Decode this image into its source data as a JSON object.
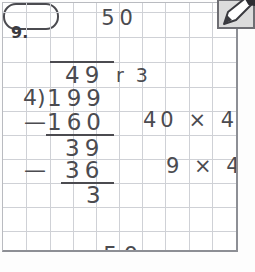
{
  "worksheet": {
    "problem_number": "9.",
    "boxed_answer": "50",
    "answer_sentence_number": "50",
    "answer_sentence_unit": "pages"
  },
  "long_division": {
    "quotient": "49",
    "remainder_label": "r 3",
    "divisor": "4)",
    "dividend": "199",
    "minus_sign_1": "—",
    "subtrahend_1": "160",
    "partial_remainder": "39",
    "minus_sign_2": "—",
    "subtrahend_2": "36",
    "final_remainder": "3"
  },
  "side_notes": {
    "note_1": "40 × 4",
    "note_2": "9 × 4"
  },
  "icons": {
    "edit_pencil": "edit-pencil-icon"
  },
  "colors": {
    "ink": "#4b4b50",
    "grid_line": "#cfd1d6",
    "sheet_border": "#8d8f95",
    "page_background": "#fdfdfd"
  }
}
